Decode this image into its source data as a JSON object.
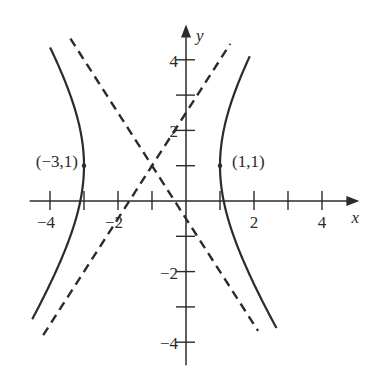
{
  "chart_data": {
    "type": "line",
    "title": "",
    "xlabel": "x",
    "ylabel": "y",
    "xlim": [
      -4.6,
      5.1
    ],
    "ylim": [
      -4.65,
      5.0
    ],
    "grid": false,
    "legend": null,
    "equation": "(x+1)^2/4 - (y-1)^2/9 = 1",
    "center": [
      -1,
      1
    ],
    "a": 2,
    "b": 3,
    "x_ticks": [
      -4,
      -3,
      -2,
      -1,
      1,
      2,
      3,
      4
    ],
    "x_tick_labels": [
      {
        "value": -4,
        "label": "−4"
      },
      {
        "value": -2,
        "label": "−2"
      },
      {
        "value": 2,
        "label": "2"
      },
      {
        "value": 4,
        "label": "4"
      }
    ],
    "y_ticks": [
      -4,
      -3,
      -2,
      -1,
      1,
      2,
      3,
      4
    ],
    "y_tick_labels": [
      {
        "value": 4,
        "label": "4"
      },
      {
        "value": 2,
        "label": "2"
      },
      {
        "value": -2,
        "label": "−2"
      },
      {
        "value": -4,
        "label": "−4"
      }
    ],
    "series": [
      {
        "name": "hyperbola-left-branch",
        "style": "solid",
        "kind": "hyperbola",
        "branch": "left",
        "y_range": [
          -3.35,
          4.35
        ]
      },
      {
        "name": "hyperbola-right-branch",
        "style": "solid",
        "kind": "hyperbola",
        "branch": "right",
        "y_range": [
          -3.6,
          4.1
        ]
      },
      {
        "name": "asymptote-negative-slope",
        "style": "dashed",
        "kind": "line",
        "slope": -1.5,
        "through": [
          -1,
          1
        ],
        "x_range": [
          -3.4,
          2.12
        ]
      },
      {
        "name": "asymptote-positive-slope",
        "style": "dashed",
        "kind": "line",
        "slope": 1.5,
        "through": [
          -1,
          1
        ],
        "x_range": [
          -4.2,
          1.3
        ]
      }
    ],
    "points": [
      {
        "x": -3,
        "y": 1,
        "label": "(−3,1)",
        "label_side": "left"
      },
      {
        "x": 1,
        "y": 1,
        "label": "(1,1)",
        "label_side": "right"
      }
    ]
  }
}
